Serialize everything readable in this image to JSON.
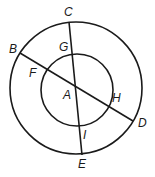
{
  "diagram": {
    "type": "concentric-circles-with-intersecting-chords",
    "outer_circle": {
      "cx": 76,
      "cy": 88,
      "r": 66
    },
    "inner_circle": {
      "cx": 77,
      "cy": 90,
      "r": 36
    },
    "center_point": {
      "label": "A",
      "x": 77,
      "y": 87
    },
    "lines": [
      {
        "name": "CE",
        "from": "C",
        "to": "E",
        "x1": 69,
        "y1": 22,
        "x2": 82,
        "y2": 155
      },
      {
        "name": "BD",
        "from": "B",
        "to": "D",
        "x1": 20,
        "y1": 53,
        "x2": 133,
        "y2": 121
      }
    ],
    "labels": [
      {
        "text": "C",
        "x": 64,
        "y": 16
      },
      {
        "text": "B",
        "x": 9,
        "y": 53
      },
      {
        "text": "G",
        "x": 59,
        "y": 51
      },
      {
        "text": "F",
        "x": 29,
        "y": 77
      },
      {
        "text": "A",
        "x": 63,
        "y": 99
      },
      {
        "text": "H",
        "x": 112,
        "y": 102
      },
      {
        "text": "D",
        "x": 138,
        "y": 127
      },
      {
        "text": "I",
        "x": 83,
        "y": 139
      },
      {
        "text": "E",
        "x": 78,
        "y": 168
      }
    ],
    "stroke_color": "#1a1a1a"
  }
}
